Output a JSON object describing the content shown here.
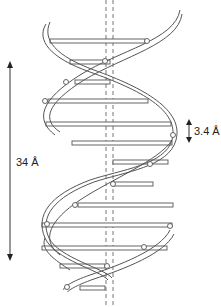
{
  "diagram": {
    "labels": {
      "full_turn": "34 Å",
      "base_pair_spacing": "3.4 Å"
    },
    "colors": {
      "line": "#555555",
      "text": "#222222",
      "background": "#ffffff"
    }
  }
}
